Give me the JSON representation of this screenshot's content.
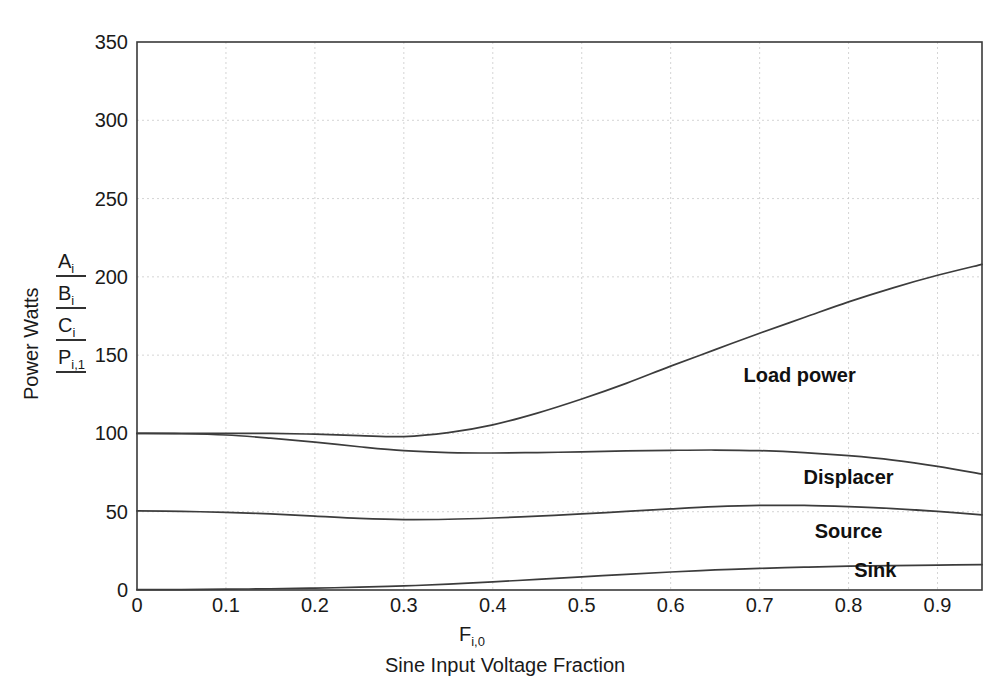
{
  "chart_data": {
    "type": "line",
    "title": "",
    "xlabel": "Sine Input Voltage Fraction",
    "xlabel_symbol": "F",
    "xlabel_symbol_sub": "i,0",
    "ylabel": "Power Watts",
    "ylabel_terms": [
      "A",
      "B",
      "C",
      "P"
    ],
    "ylabel_term_subs": [
      "i",
      "i",
      "i",
      "i,1"
    ],
    "xlim": [
      0,
      0.95
    ],
    "ylim": [
      0,
      350
    ],
    "xticks": [
      "0",
      "0.1",
      "0.2",
      "0.3",
      "0.4",
      "0.5",
      "0.6",
      "0.7",
      "0.8",
      "0.9"
    ],
    "xtick_values": [
      0,
      0.1,
      0.2,
      0.3,
      0.4,
      0.5,
      0.6,
      0.7,
      0.8,
      0.9
    ],
    "yticks": [
      "0",
      "50",
      "100",
      "150",
      "200",
      "250",
      "300",
      "350"
    ],
    "ytick_values": [
      0,
      50,
      100,
      150,
      200,
      250,
      300,
      350
    ],
    "grid": true,
    "legend_position": "inline-right",
    "x": [
      0.0,
      0.05,
      0.1,
      0.15,
      0.2,
      0.25,
      0.3,
      0.35,
      0.4,
      0.45,
      0.5,
      0.55,
      0.6,
      0.65,
      0.7,
      0.75,
      0.8,
      0.85,
      0.9,
      0.95
    ],
    "series": [
      {
        "name": "Load power",
        "label": "Load power",
        "values": [
          100,
          100,
          100,
          100,
          99.5,
          98.6,
          98.0,
          100.5,
          105.5,
          113,
          122,
          132,
          143,
          153.5,
          164,
          174,
          184,
          193,
          201,
          208
        ]
      },
      {
        "name": "Displacer",
        "label": "Displacer",
        "values": [
          100,
          99.8,
          99.0,
          97.0,
          94.5,
          91.5,
          89.0,
          87.8,
          87.5,
          87.8,
          88.2,
          88.8,
          89.2,
          89.4,
          89.0,
          87.8,
          85.8,
          83.0,
          79.0,
          74.0
        ]
      },
      {
        "name": "Source",
        "label": "Source",
        "values": [
          50.5,
          50.2,
          49.6,
          48.6,
          47.2,
          45.8,
          45.0,
          45.2,
          46.0,
          47.2,
          48.6,
          50.2,
          51.8,
          53.2,
          54.0,
          54.0,
          53.2,
          52.0,
          50.2,
          48.0
        ]
      },
      {
        "name": "Sink",
        "label": "Sink",
        "values": [
          0.2,
          0.3,
          0.5,
          0.8,
          1.2,
          1.8,
          2.6,
          3.8,
          5.2,
          6.8,
          8.4,
          10.0,
          11.5,
          12.8,
          13.8,
          14.6,
          15.2,
          15.6,
          15.9,
          16.2
        ]
      }
    ],
    "series_label_positions": [
      {
        "x": 0.745,
        "y": 133
      },
      {
        "x": 0.8,
        "y": 68
      },
      {
        "x": 0.8,
        "y": 33
      },
      {
        "x": 0.83,
        "y": 8
      }
    ],
    "colors": {
      "curve": "#3c3c3c",
      "frame": "#3a3a3a",
      "grid": "#c9c9c9",
      "text": "#1a1a1a",
      "background": "#ffffff"
    }
  }
}
